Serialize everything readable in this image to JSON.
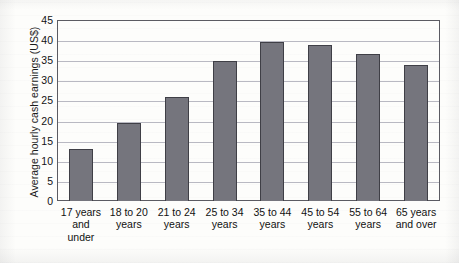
{
  "chart_data": {
    "type": "bar",
    "title": "",
    "xlabel": "",
    "ylabel": "Average hourly cash earnings (US$)",
    "ylim": [
      0,
      45
    ],
    "ytick_step": 5,
    "yticks": [
      "0",
      "5",
      "10",
      "15",
      "20",
      "25",
      "30",
      "35",
      "40",
      "45"
    ],
    "grid": true,
    "legend": false,
    "bar_color": "#75757d",
    "bar_edge_color": "#3f3f46",
    "grid_color": "#b9b9c2",
    "axis_color": "#5b5b62",
    "categories": [
      "17 years\nand\nunder",
      "18 to 20\nyears",
      "21 to 24\nyears",
      "25 to 34\nyears",
      "35 to 44\nyears",
      "45 to 54\nyears",
      "55 to 64\nyears",
      "65 years\nand over"
    ],
    "values": [
      12.9,
      19.4,
      25.8,
      34.8,
      39.5,
      38.8,
      36.5,
      33.8
    ]
  }
}
